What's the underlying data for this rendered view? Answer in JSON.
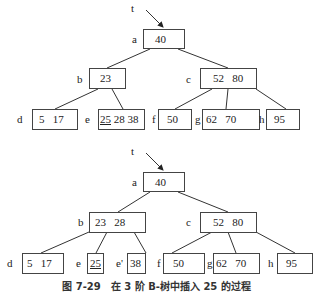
{
  "caption": "图 7-29　在 3 阶 B-树中插入 25 的过程",
  "tree1": {
    "pointer": "t",
    "a": {
      "label": "a",
      "keys": "40"
    },
    "b": {
      "label": "b",
      "keys": "23"
    },
    "c": {
      "label": "c",
      "keys": "52   80"
    },
    "d": {
      "label": "d",
      "keys": "5   17"
    },
    "e": {
      "label": "e",
      "key_new": "25",
      "keys": " 28 38"
    },
    "f": {
      "label": "f",
      "keys": "50"
    },
    "g": {
      "label": "g",
      "keys": "62   70"
    },
    "h": {
      "label": "h",
      "keys": "95"
    }
  },
  "tree2": {
    "pointer": "t",
    "a": {
      "label": "a",
      "keys": "40"
    },
    "b": {
      "label": "b",
      "keys": "23   28"
    },
    "c": {
      "label": "c",
      "keys": "52   80"
    },
    "d": {
      "label": "d",
      "keys": "5   17"
    },
    "e": {
      "label": "e",
      "key_new": "25"
    },
    "e2": {
      "label": "e'",
      "keys": "38"
    },
    "f": {
      "label": "f",
      "keys": "50"
    },
    "g": {
      "label": "g",
      "keys": "62   70"
    },
    "h": {
      "label": "h",
      "keys": "95"
    }
  }
}
